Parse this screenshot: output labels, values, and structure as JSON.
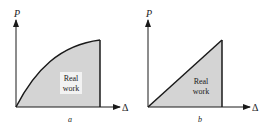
{
  "diagrams": [
    {
      "id": "a",
      "caption": "a",
      "y_axis_label": "P",
      "x_axis_label": "Δ",
      "region_label_line1": "Real",
      "region_label_line2": "work",
      "curve_type": "concave-rising curve"
    },
    {
      "id": "b",
      "caption": "b",
      "y_axis_label": "P",
      "x_axis_label": "Δ",
      "region_label_line1": "Real",
      "region_label_line2": "work",
      "curve_type": "linear"
    }
  ],
  "colors": {
    "fill": "#d4d4d4",
    "line": "#1a1a1a",
    "label_bg": "#f2f2f2"
  }
}
